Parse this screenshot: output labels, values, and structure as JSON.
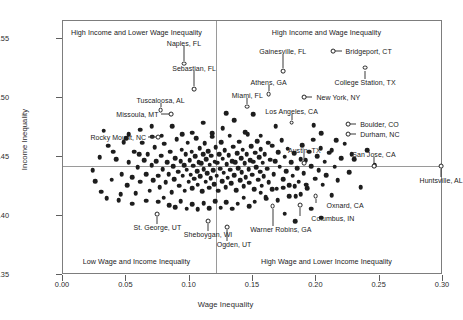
{
  "chart_data": {
    "type": "scatter",
    "title": "",
    "xlabel": "Wage Inequality",
    "ylabel": "Income Inequality",
    "xlim": [
      0.0,
      0.3
    ],
    "ylim": [
      0.35,
      0.565
    ],
    "xticks": [
      "0.00",
      "0.05",
      "0.10",
      "0.15",
      "0.20",
      "0.25",
      "0.30"
    ],
    "xtick_values": [
      0.0,
      0.05,
      0.1,
      0.15,
      0.2,
      0.25,
      0.3
    ],
    "yticks": [
      "0.35",
      "0.40",
      "0.45",
      "0.50",
      "0.55"
    ],
    "ytick_values": [
      0.35,
      0.4,
      0.45,
      0.5,
      0.55
    ],
    "grid": false,
    "legend": "none",
    "reference_lines": {
      "vertical_x": 0.121,
      "horizontal_y": 0.4425
    },
    "quadrant_labels": [
      {
        "text": "High Income and Lower Wage Inequality",
        "x": 0.058,
        "y": 0.5555
      },
      {
        "text": "High Income and Wage Inequality",
        "x": 0.208,
        "y": 0.5555
      },
      {
        "text": "Low Wage and Income Inequality",
        "x": 0.058,
        "y": 0.362
      },
      {
        "text": "High Wage and Lower Income Inequality",
        "x": 0.208,
        "y": 0.362
      }
    ],
    "labeled_points": [
      {
        "label": "Naples, FL",
        "x": 0.0955,
        "y": 0.529,
        "label_x": 0.0955,
        "label_y": 0.5465,
        "leader": "up"
      },
      {
        "label": "Sebastian, FL",
        "x": 0.1035,
        "y": 0.5075,
        "label_x": 0.1035,
        "label_y": 0.525,
        "leader": "up"
      },
      {
        "label": "Tuscaloosa, AL",
        "x": 0.077,
        "y": 0.4895,
        "label_x": 0.077,
        "label_y": 0.4985,
        "leader": "up"
      },
      {
        "label": "Missoula, MT",
        "x": 0.0855,
        "y": 0.486,
        "label_x": 0.077,
        "label_y": 0.486,
        "leader": "left"
      },
      {
        "label": "Rocky Mount, NC",
        "x": 0.0748,
        "y": 0.4665,
        "label_x": 0.0672,
        "label_y": 0.4665,
        "leader": "left"
      },
      {
        "label": "Miami, FL",
        "x": 0.1455,
        "y": 0.4925,
        "label_x": 0.1455,
        "label_y": 0.502,
        "leader": "up"
      },
      {
        "label": "Gainesville, FL",
        "x": 0.1735,
        "y": 0.5225,
        "label_x": 0.1735,
        "label_y": 0.5395,
        "leader": "up"
      },
      {
        "label": "Athens, GA",
        "x": 0.1623,
        "y": 0.503,
        "label_x": 0.1623,
        "label_y": 0.513,
        "leader": "up"
      },
      {
        "label": "Bridgeport, CT",
        "x": 0.2135,
        "y": 0.5395,
        "label_x": 0.2215,
        "label_y": 0.5395,
        "leader": "right"
      },
      {
        "label": "College Station, TX",
        "x": 0.2385,
        "y": 0.5255,
        "label_x": 0.2385,
        "label_y": 0.5135,
        "leader": "down"
      },
      {
        "label": "New York, NY",
        "x": 0.1905,
        "y": 0.5005,
        "label_x": 0.1985,
        "label_y": 0.5005,
        "leader": "right"
      },
      {
        "label": "Los Angeles, CA",
        "x": 0.1805,
        "y": 0.479,
        "label_x": 0.1805,
        "label_y": 0.489,
        "leader": "up"
      },
      {
        "label": "Boulder, CO",
        "x": 0.225,
        "y": 0.4775,
        "label_x": 0.233,
        "label_y": 0.4775,
        "leader": "right"
      },
      {
        "label": "Durham, NC",
        "x": 0.225,
        "y": 0.469,
        "label_x": 0.233,
        "label_y": 0.469,
        "leader": "right"
      },
      {
        "label": "Austin, TX",
        "x": 0.1905,
        "y": 0.445,
        "label_x": 0.1905,
        "label_y": 0.456,
        "leader": "up"
      },
      {
        "label": "San Jose, CA",
        "x": 0.2455,
        "y": 0.442,
        "label_x": 0.2455,
        "label_y": 0.452,
        "leader": "up"
      },
      {
        "label": "Huntsville, AL",
        "x": 0.2985,
        "y": 0.442,
        "label_x": 0.2985,
        "label_y": 0.4305,
        "leader": "down"
      },
      {
        "label": "Oxnard, CA",
        "x": 0.1995,
        "y": 0.417,
        "label_x": 0.2065,
        "label_y": 0.409,
        "leader": "down-right"
      },
      {
        "label": "Columbus, IN",
        "x": 0.187,
        "y": 0.409,
        "label_x": 0.1945,
        "label_y": 0.3985,
        "leader": "down-right"
      },
      {
        "label": "Warner Robins, GA",
        "x": 0.1655,
        "y": 0.408,
        "label_x": 0.172,
        "label_y": 0.389,
        "leader": "down"
      },
      {
        "label": "St. George, UT",
        "x": 0.0745,
        "y": 0.4015,
        "label_x": 0.0745,
        "label_y": 0.391,
        "leader": "down"
      },
      {
        "label": "Sheboygan, WI",
        "x": 0.1145,
        "y": 0.3955,
        "label_x": 0.1145,
        "label_y": 0.3845,
        "leader": "down"
      },
      {
        "label": "Ogden, UT",
        "x": 0.1295,
        "y": 0.3905,
        "label_x": 0.135,
        "label_y": 0.376,
        "leader": "down"
      }
    ],
    "points": [
      [
        0.0235,
        0.4385
      ],
      [
        0.03,
        0.4205
      ],
      [
        0.0355,
        0.4595
      ],
      [
        0.0385,
        0.4305
      ],
      [
        0.042,
        0.448
      ],
      [
        0.044,
        0.4135
      ],
      [
        0.0465,
        0.4355
      ],
      [
        0.048,
        0.4625
      ],
      [
        0.0505,
        0.426
      ],
      [
        0.052,
        0.4455
      ],
      [
        0.0545,
        0.433
      ],
      [
        0.056,
        0.4545
      ],
      [
        0.0575,
        0.419
      ],
      [
        0.059,
        0.441
      ],
      [
        0.061,
        0.429
      ],
      [
        0.0625,
        0.462
      ],
      [
        0.064,
        0.447
      ],
      [
        0.0655,
        0.4355
      ],
      [
        0.067,
        0.452
      ],
      [
        0.0685,
        0.4215
      ],
      [
        0.07,
        0.443
      ],
      [
        0.0712,
        0.43
      ],
      [
        0.0725,
        0.458
      ],
      [
        0.0738,
        0.4465
      ],
      [
        0.075,
        0.434
      ],
      [
        0.0762,
        0.4245
      ],
      [
        0.0775,
        0.451
      ],
      [
        0.0788,
        0.4395
      ],
      [
        0.08,
        0.461
      ],
      [
        0.0812,
        0.4285
      ],
      [
        0.0822,
        0.4455
      ],
      [
        0.0835,
        0.4355
      ],
      [
        0.0845,
        0.4545
      ],
      [
        0.0858,
        0.42
      ],
      [
        0.0868,
        0.442
      ],
      [
        0.0878,
        0.431
      ],
      [
        0.0888,
        0.449
      ],
      [
        0.0898,
        0.465
      ],
      [
        0.0908,
        0.4375
      ],
      [
        0.0918,
        0.4255
      ],
      [
        0.0928,
        0.4465
      ],
      [
        0.0938,
        0.456
      ],
      [
        0.0945,
        0.434
      ],
      [
        0.0955,
        0.443
      ],
      [
        0.0962,
        0.4215
      ],
      [
        0.097,
        0.452
      ],
      [
        0.0978,
        0.439
      ],
      [
        0.0985,
        0.462
      ],
      [
        0.0992,
        0.429
      ],
      [
        0.1,
        0.447
      ],
      [
        0.1008,
        0.435
      ],
      [
        0.1015,
        0.4545
      ],
      [
        0.1022,
        0.4235
      ],
      [
        0.103,
        0.4425
      ],
      [
        0.1038,
        0.4315
      ],
      [
        0.1045,
        0.4505
      ],
      [
        0.1052,
        0.466
      ],
      [
        0.1058,
        0.438
      ],
      [
        0.1065,
        0.4265
      ],
      [
        0.1072,
        0.4455
      ],
      [
        0.1078,
        0.4575
      ],
      [
        0.1085,
        0.4335
      ],
      [
        0.1092,
        0.4445
      ],
      [
        0.1098,
        0.421
      ],
      [
        0.1105,
        0.452
      ],
      [
        0.1112,
        0.4395
      ],
      [
        0.1118,
        0.4615
      ],
      [
        0.1125,
        0.429
      ],
      [
        0.1132,
        0.448
      ],
      [
        0.1138,
        0.436
      ],
      [
        0.1145,
        0.455
      ],
      [
        0.1152,
        0.424
      ],
      [
        0.1158,
        0.4435
      ],
      [
        0.1165,
        0.432
      ],
      [
        0.1172,
        0.451
      ],
      [
        0.1178,
        0.467
      ],
      [
        0.1185,
        0.4385
      ],
      [
        0.1192,
        0.427
      ],
      [
        0.1198,
        0.446
      ],
      [
        0.1205,
        0.458
      ],
      [
        0.1212,
        0.434
      ],
      [
        0.1218,
        0.445
      ],
      [
        0.1225,
        0.4215
      ],
      [
        0.1232,
        0.4525
      ],
      [
        0.124,
        0.44
      ],
      [
        0.1248,
        0.4625
      ],
      [
        0.1255,
        0.4295
      ],
      [
        0.1262,
        0.4485
      ],
      [
        0.127,
        0.4365
      ],
      [
        0.1278,
        0.4555
      ],
      [
        0.1285,
        0.4245
      ],
      [
        0.1292,
        0.444
      ],
      [
        0.13,
        0.4325
      ],
      [
        0.1308,
        0.4515
      ],
      [
        0.1315,
        0.468
      ],
      [
        0.1322,
        0.439
      ],
      [
        0.133,
        0.4275
      ],
      [
        0.1338,
        0.4465
      ],
      [
        0.1345,
        0.4585
      ],
      [
        0.1352,
        0.4345
      ],
      [
        0.136,
        0.4455
      ],
      [
        0.1368,
        0.422
      ],
      [
        0.1375,
        0.453
      ],
      [
        0.1382,
        0.4405
      ],
      [
        0.139,
        0.463
      ],
      [
        0.1398,
        0.43
      ],
      [
        0.1405,
        0.449
      ],
      [
        0.1412,
        0.437
      ],
      [
        0.142,
        0.456
      ],
      [
        0.1428,
        0.425
      ],
      [
        0.1435,
        0.4445
      ],
      [
        0.1442,
        0.433
      ],
      [
        0.145,
        0.452
      ],
      [
        0.1458,
        0.469
      ],
      [
        0.1465,
        0.4395
      ],
      [
        0.1472,
        0.428
      ],
      [
        0.148,
        0.447
      ],
      [
        0.1488,
        0.459
      ],
      [
        0.1495,
        0.435
      ],
      [
        0.1502,
        0.446
      ],
      [
        0.151,
        0.4225
      ],
      [
        0.1518,
        0.4535
      ],
      [
        0.1525,
        0.441
      ],
      [
        0.1532,
        0.4635
      ],
      [
        0.154,
        0.4305
      ],
      [
        0.1548,
        0.4495
      ],
      [
        0.1555,
        0.4375
      ],
      [
        0.1562,
        0.4565
      ],
      [
        0.157,
        0.4255
      ],
      [
        0.1578,
        0.445
      ],
      [
        0.1585,
        0.4335
      ],
      [
        0.1592,
        0.4525
      ],
      [
        0.16,
        0.416
      ],
      [
        0.1612,
        0.44
      ],
      [
        0.1625,
        0.4285
      ],
      [
        0.1638,
        0.4475
      ],
      [
        0.165,
        0.4595
      ],
      [
        0.1662,
        0.4355
      ],
      [
        0.1675,
        0.4465
      ],
      [
        0.1688,
        0.423
      ],
      [
        0.17,
        0.454
      ],
      [
        0.1712,
        0.4415
      ],
      [
        0.1725,
        0.464
      ],
      [
        0.1738,
        0.431
      ],
      [
        0.175,
        0.45
      ],
      [
        0.1762,
        0.438
      ],
      [
        0.1775,
        0.457
      ],
      [
        0.1788,
        0.426
      ],
      [
        0.18,
        0.4455
      ],
      [
        0.1812,
        0.434
      ],
      [
        0.1825,
        0.453
      ],
      [
        0.1838,
        0.4165
      ],
      [
        0.185,
        0.4405
      ],
      [
        0.1862,
        0.429
      ],
      [
        0.1875,
        0.448
      ],
      [
        0.1888,
        0.46
      ],
      [
        0.19,
        0.436
      ],
      [
        0.1915,
        0.447
      ],
      [
        0.193,
        0.4235
      ],
      [
        0.1945,
        0.4545
      ],
      [
        0.196,
        0.442
      ],
      [
        0.1975,
        0.4645
      ],
      [
        0.199,
        0.4315
      ],
      [
        0.2005,
        0.4505
      ],
      [
        0.202,
        0.4385
      ],
      [
        0.2035,
        0.4575
      ],
      [
        0.205,
        0.4265
      ],
      [
        0.2065,
        0.446
      ],
      [
        0.208,
        0.4345
      ],
      [
        0.21,
        0.4535
      ],
      [
        0.212,
        0.4175
      ],
      [
        0.2145,
        0.4415
      ],
      [
        0.217,
        0.43
      ],
      [
        0.2195,
        0.449
      ],
      [
        0.2225,
        0.461
      ],
      [
        0.226,
        0.437
      ],
      [
        0.23,
        0.448
      ],
      [
        0.235,
        0.4245
      ],
      [
        0.24,
        0.4555
      ],
      [
        0.246,
        0.443
      ],
      [
        0.029,
        0.4495
      ],
      [
        0.0345,
        0.415
      ],
      [
        0.0395,
        0.4545
      ],
      [
        0.0455,
        0.4185
      ],
      [
        0.05,
        0.466
      ],
      [
        0.0545,
        0.4105
      ],
      [
        0.06,
        0.452
      ],
      [
        0.0655,
        0.413
      ],
      [
        0.0705,
        0.467
      ],
      [
        0.075,
        0.412
      ],
      [
        0.0795,
        0.4155
      ],
      [
        0.084,
        0.409
      ],
      [
        0.0885,
        0.4075
      ],
      [
        0.093,
        0.4125
      ],
      [
        0.0975,
        0.406
      ],
      [
        0.102,
        0.41
      ],
      [
        0.1065,
        0.4055
      ],
      [
        0.111,
        0.411
      ],
      [
        0.1155,
        0.4065
      ],
      [
        0.12,
        0.4125
      ],
      [
        0.1245,
        0.407
      ],
      [
        0.129,
        0.4115
      ],
      [
        0.1335,
        0.406
      ],
      [
        0.138,
        0.4105
      ],
      [
        0.1425,
        0.4155
      ],
      [
        0.147,
        0.408
      ],
      [
        0.1515,
        0.412
      ],
      [
        0.156,
        0.4195
      ],
      [
        0.1605,
        0.4145
      ],
      [
        0.165,
        0.4225
      ],
      [
        0.1695,
        0.4135
      ],
      [
        0.174,
        0.424
      ],
      [
        0.1785,
        0.4165
      ],
      [
        0.183,
        0.425
      ],
      [
        0.1875,
        0.4185
      ],
      [
        0.192,
        0.4265
      ],
      [
        0.032,
        0.472
      ],
      [
        0.061,
        0.473
      ],
      [
        0.086,
        0.476
      ],
      [
        0.1105,
        0.479
      ],
      [
        0.135,
        0.481
      ],
      [
        0.15,
        0.486
      ],
      [
        0.126,
        0.4745
      ],
      [
        0.102,
        0.4705
      ],
      [
        0.144,
        0.471
      ],
      [
        0.168,
        0.476
      ],
      [
        0.156,
        0.468
      ],
      [
        0.129,
        0.487
      ],
      [
        0.07,
        0.476
      ],
      [
        0.094,
        0.469
      ],
      [
        0.118,
        0.47
      ],
      [
        0.162,
        0.462
      ],
      [
        0.204,
        0.47
      ],
      [
        0.2155,
        0.464
      ],
      [
        0.198,
        0.477
      ],
      [
        0.228,
        0.452
      ],
      [
        0.0255,
        0.4295
      ],
      [
        0.052,
        0.469
      ],
      [
        0.078,
        0.468
      ],
      [
        0.212,
        0.4555
      ],
      [
        0.196,
        0.406
      ],
      [
        0.204,
        0.3985
      ],
      [
        0.175,
        0.402
      ],
      [
        0.1835,
        0.3955
      ]
    ]
  }
}
